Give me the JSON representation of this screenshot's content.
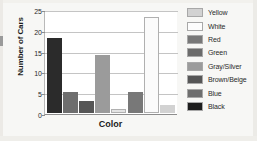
{
  "chart_data": {
    "type": "bar",
    "title": "",
    "xlabel": "Color",
    "ylabel": "Number of Cars",
    "categories": [
      "Black",
      "Blue",
      "Brown/Beige",
      "Gray/Silver",
      "Green",
      "Red",
      "White",
      "Yellow"
    ],
    "values": [
      18,
      5,
      3,
      14,
      1,
      5,
      23,
      2
    ],
    "bar_colors": [
      "#2b2b2b",
      "#6e6e6e",
      "#565656",
      "#9b9b9b",
      "#e3e3e3",
      "#787878",
      "#fbfbfb",
      "#d2d2d2"
    ],
    "ylim": [
      0,
      25
    ],
    "yticks": [
      0,
      5,
      10,
      15,
      20,
      25
    ],
    "ytick_labels": [
      "0",
      "5",
      "10",
      "15",
      "20",
      "25"
    ],
    "grid": true,
    "legend_position": "right",
    "legend": [
      {
        "label": "Yellow",
        "color": "#d2d2d2"
      },
      {
        "label": "White",
        "color": "#fdfdfd"
      },
      {
        "label": "Red",
        "color": "#787878"
      },
      {
        "label": "Green",
        "color": "#6b6b6b"
      },
      {
        "label": "Gray/Silver",
        "color": "#9b9b9b"
      },
      {
        "label": "Brown/Beige",
        "color": "#565656"
      },
      {
        "label": "Blue",
        "color": "#6e6e6e"
      },
      {
        "label": "Black",
        "color": "#1d1d1d"
      }
    ]
  }
}
